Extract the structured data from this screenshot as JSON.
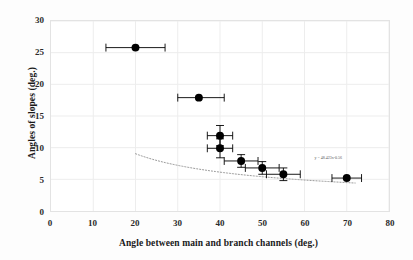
{
  "chart_data": {
    "type": "scatter",
    "title": "",
    "xlabel": "Angle between main and branch channels (deg.)",
    "ylabel": "Angles of slopes (deg.)",
    "xlim": [
      0,
      80
    ],
    "ylim": [
      0,
      30
    ],
    "xticks": [
      0,
      10,
      20,
      30,
      40,
      50,
      60,
      70,
      80
    ],
    "yticks": [
      0,
      5,
      10,
      15,
      20,
      25,
      30
    ],
    "grid": true,
    "legend": "none",
    "marker_color": "#000000",
    "errorbar_color": "#000000",
    "trendline_color": "#9a9a9a",
    "gridline_color": "#ededed",
    "points": [
      {
        "x": 20.0,
        "y": 25.8,
        "xerr_low": 7.0,
        "xerr_high": 7.0,
        "yerr": 0.0
      },
      {
        "x": 35.0,
        "y": 17.9,
        "xerr_low": 5.0,
        "xerr_high": 6.0,
        "yerr": 0.0
      },
      {
        "x": 40.0,
        "y": 11.9,
        "xerr_low": 3.0,
        "xerr_high": 3.0,
        "yerr": 1.6
      },
      {
        "x": 40.0,
        "y": 9.9,
        "xerr_low": 3.0,
        "xerr_high": 3.0,
        "yerr": 1.5
      },
      {
        "x": 45.0,
        "y": 7.9,
        "xerr_low": 4.0,
        "xerr_high": 4.0,
        "yerr": 1.0
      },
      {
        "x": 50.0,
        "y": 6.8,
        "xerr_low": 4.0,
        "xerr_high": 4.0,
        "yerr": 1.0
      },
      {
        "x": 55.0,
        "y": 5.8,
        "xerr_low": 4.0,
        "xerr_high": 4.0,
        "yerr": 1.0
      },
      {
        "x": 70.0,
        "y": 5.2,
        "xerr_low": 3.5,
        "xerr_high": 3.5,
        "yerr": 0.0
      }
    ],
    "trendline": {
      "type": "power",
      "equation_label": "y = 48.423x-0.56",
      "coefficient": 48.423,
      "exponent": -0.56,
      "x_start": 20.0,
      "x_end": 72.0
    }
  },
  "axes": {
    "y_title": "Angles of slopes (deg.)",
    "x_title": "Angle between main and branch channels (deg.)",
    "y_tick_labels": [
      "0",
      "5",
      "10",
      "15",
      "20",
      "25",
      "30"
    ],
    "x_tick_labels": [
      "0",
      "10",
      "20",
      "30",
      "40",
      "50",
      "60",
      "70",
      "80"
    ]
  }
}
